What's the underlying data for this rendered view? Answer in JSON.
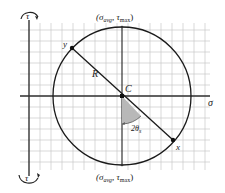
{
  "diagram": {
    "axes": {
      "sigma": "σ",
      "tau_top": "τ",
      "tau_bottom": "τ"
    },
    "points": {
      "center": "C",
      "x": "x",
      "y": "y",
      "radius": "R"
    },
    "top_label": {
      "open": "(σ",
      "sub1": "avg",
      "sep": ", τ",
      "sub2": "max",
      "close": ")"
    },
    "bottom_label": {
      "open": "(σ",
      "sub1": "avg",
      "sep": ", τ",
      "sub2": "max",
      "close": ")"
    },
    "angle_label": {
      "main": "2θ",
      "sub": "s"
    },
    "colors": {
      "grid": "#c8c8c8",
      "axis": "#333333",
      "circle": "#1a1a1a",
      "wedge": "#b5b5b5"
    }
  }
}
